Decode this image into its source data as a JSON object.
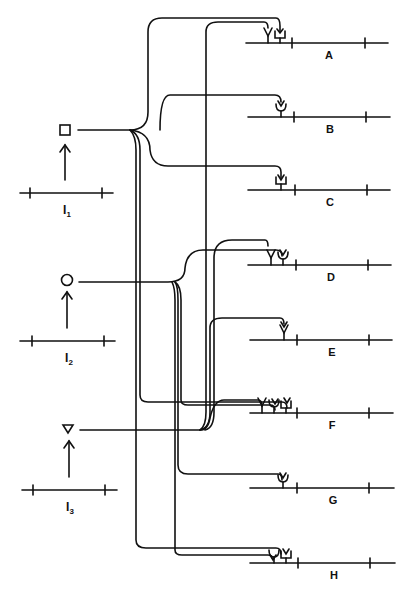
{
  "figure": {
    "inputs": [
      {
        "id": "I1",
        "label_main": "I",
        "label_sub": "1",
        "symbol": "square",
        "symbol_y": 130,
        "line_y": 192
      },
      {
        "id": "I2",
        "label_main": "I",
        "label_sub": "2",
        "symbol": "circle",
        "symbol_y": 282,
        "line_y": 342
      },
      {
        "id": "I3",
        "label_main": "I",
        "label_sub": "3",
        "symbol": "triangle",
        "symbol_y": 430,
        "line_y": 492
      }
    ],
    "targets": [
      {
        "label": "A",
        "line_y": 43,
        "receptors": [
          "triangle",
          "square"
        ]
      },
      {
        "label": "B",
        "line_y": 117,
        "receptors": [
          "circle"
        ]
      },
      {
        "label": "C",
        "line_y": 190,
        "receptors": [
          "square"
        ]
      },
      {
        "label": "D",
        "line_y": 265,
        "receptors": [
          "triangle",
          "circle"
        ]
      },
      {
        "label": "E",
        "line_y": 340,
        "receptors": [
          "triangle"
        ]
      },
      {
        "label": "F",
        "line_y": 413,
        "receptors": [
          "triangle",
          "circle",
          "square"
        ]
      },
      {
        "label": "G",
        "line_y": 488,
        "receptors": [
          "circle"
        ]
      },
      {
        "label": "H",
        "line_y": 563,
        "receptors": [
          "circle",
          "square"
        ]
      }
    ],
    "caption_fragment": "Fig. ... Diagram representing ... of the ... connections between ... and ..."
  },
  "colors": {
    "ink": "#111111",
    "background": "#ffffff"
  }
}
